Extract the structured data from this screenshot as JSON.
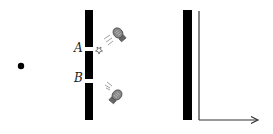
{
  "diagram": {
    "source": {
      "name": "point source",
      "x": 21,
      "y": 66,
      "r": 3.2
    },
    "barrier": {
      "x": 85,
      "width": 8,
      "top": 10,
      "bottom": 120,
      "slits": [
        {
          "label": "A",
          "y_top": 47,
          "y_bottom": 51
        },
        {
          "label": "B",
          "y_top": 79,
          "y_bottom": 83
        }
      ]
    },
    "screen": {
      "x": 183,
      "width": 9,
      "top": 10,
      "bottom": 120
    },
    "axes": {
      "origin_x": 199,
      "origin_y": 120,
      "top_y": 11,
      "arrow_end_x": 258
    },
    "detectors": [
      {
        "name": "lamp-A",
        "x": 118,
        "y": 33,
        "target": "A",
        "flash": true
      },
      {
        "name": "lamp-B",
        "x": 117,
        "y": 95,
        "target": "B",
        "flash": false
      }
    ],
    "labels": {
      "A": "A",
      "B": "B"
    },
    "colors": {
      "ink": "#000000",
      "axis": "#333333",
      "lamp": "#666666",
      "background": "#ffffff"
    }
  }
}
